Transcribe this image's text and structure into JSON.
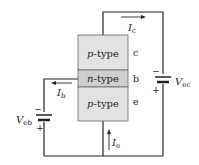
{
  "diagram": {
    "type": "pnp-transistor-common-base-circuit",
    "regions": [
      {
        "name": "collector",
        "material_prefix": "p",
        "material_suffix": "-type",
        "terminal": "c",
        "fill": "#e2e2e2"
      },
      {
        "name": "base",
        "material_prefix": "n",
        "material_suffix": "-type",
        "terminal": "b",
        "fill": "#cfcfcf"
      },
      {
        "name": "emitter",
        "material_prefix": "p",
        "material_suffix": "-type",
        "terminal": "e",
        "fill": "#e2e2e2"
      }
    ],
    "currents": {
      "collector": {
        "symbol": "I",
        "subscript": "c"
      },
      "base": {
        "symbol": "I",
        "subscript": "b"
      },
      "emitter": {
        "symbol": "I",
        "subscript": "e"
      }
    },
    "batteries": {
      "vec": {
        "symbol": "V",
        "subscript": "ec",
        "minus": "−",
        "plus": "+"
      },
      "veb": {
        "symbol": "V",
        "subscript": "eb",
        "minus": "−",
        "plus": "+"
      }
    },
    "colors": {
      "wire": "#222222",
      "border": "#555555"
    }
  }
}
